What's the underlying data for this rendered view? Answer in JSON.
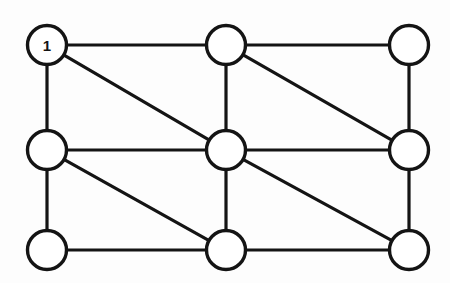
{
  "figure": {
    "background_color": "#fdfdfd",
    "stroke_color": "#141414",
    "node_fill_color": "#ffffff",
    "canvas": {
      "width": 450,
      "height": 283
    }
  },
  "graph": {
    "node_radius": 19.5,
    "edge_width": 3.2,
    "node_stroke_width": 3.4,
    "nodes": [
      {
        "id": "n1",
        "label": "1",
        "row": 0,
        "col": 0,
        "cx": 47,
        "cy": 45
      },
      {
        "id": "n2",
        "label": "",
        "row": 0,
        "col": 1,
        "cx": 226,
        "cy": 45
      },
      {
        "id": "n3",
        "label": "",
        "row": 0,
        "col": 2,
        "cx": 409,
        "cy": 45
      },
      {
        "id": "n4",
        "label": "",
        "row": 1,
        "col": 0,
        "cx": 47,
        "cy": 150
      },
      {
        "id": "n5",
        "label": "",
        "row": 1,
        "col": 1,
        "cx": 226,
        "cy": 150
      },
      {
        "id": "n6",
        "label": "",
        "row": 1,
        "col": 2,
        "cx": 409,
        "cy": 150
      },
      {
        "id": "n7",
        "label": "",
        "row": 2,
        "col": 0,
        "cx": 47,
        "cy": 250
      },
      {
        "id": "n8",
        "label": "",
        "row": 2,
        "col": 1,
        "cx": 226,
        "cy": 250
      },
      {
        "id": "n9",
        "label": "",
        "row": 2,
        "col": 2,
        "cx": 409,
        "cy": 250
      }
    ],
    "edges": [
      {
        "id": "e1",
        "from": "n1",
        "to": "n2",
        "kind": "horizontal"
      },
      {
        "id": "e2",
        "from": "n2",
        "to": "n3",
        "kind": "horizontal"
      },
      {
        "id": "e3",
        "from": "n4",
        "to": "n5",
        "kind": "horizontal"
      },
      {
        "id": "e4",
        "from": "n5",
        "to": "n6",
        "kind": "horizontal"
      },
      {
        "id": "e5",
        "from": "n7",
        "to": "n8",
        "kind": "horizontal"
      },
      {
        "id": "e6",
        "from": "n8",
        "to": "n9",
        "kind": "horizontal"
      },
      {
        "id": "e7",
        "from": "n1",
        "to": "n4",
        "kind": "vertical"
      },
      {
        "id": "e8",
        "from": "n4",
        "to": "n7",
        "kind": "vertical"
      },
      {
        "id": "e9",
        "from": "n2",
        "to": "n5",
        "kind": "vertical"
      },
      {
        "id": "e10",
        "from": "n5",
        "to": "n8",
        "kind": "vertical"
      },
      {
        "id": "e11",
        "from": "n3",
        "to": "n6",
        "kind": "vertical"
      },
      {
        "id": "e12",
        "from": "n6",
        "to": "n9",
        "kind": "vertical"
      },
      {
        "id": "e13",
        "from": "n1",
        "to": "n5",
        "kind": "diagonal"
      },
      {
        "id": "e14",
        "from": "n2",
        "to": "n6",
        "kind": "diagonal"
      },
      {
        "id": "e15",
        "from": "n4",
        "to": "n8",
        "kind": "diagonal"
      },
      {
        "id": "e16",
        "from": "n5",
        "to": "n9",
        "kind": "diagonal"
      }
    ],
    "counts": {
      "nodes": 9,
      "edges": 16
    }
  }
}
